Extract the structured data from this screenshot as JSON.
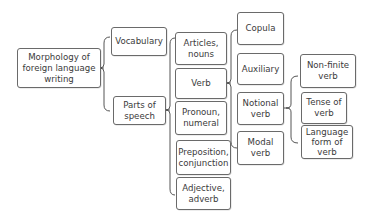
{
  "diagram": {
    "type": "tree-brace-map",
    "root": {
      "label": "Morphology of foreign language writing",
      "lines": [
        "Morphology of",
        "foreign language",
        "writing"
      ]
    },
    "level1": [
      {
        "label": "Vocabulary"
      },
      {
        "label": "Parts of speech",
        "lines": [
          "Parts of",
          "speech"
        ]
      }
    ],
    "parts_of_speech": [
      {
        "label": "Articles, nouns",
        "lines": [
          "Articles,",
          "nouns"
        ]
      },
      {
        "label": "Verb"
      },
      {
        "label": "Pronoun, numeral",
        "lines": [
          "Pronoun,",
          "numeral"
        ]
      },
      {
        "label": "Preposition, conjunction",
        "lines": [
          "Preposition,",
          "conjunction"
        ]
      },
      {
        "label": "Adjective, adverb",
        "lines": [
          "Adjective,",
          "adverb"
        ]
      }
    ],
    "verb_types": [
      {
        "label": "Copula"
      },
      {
        "label": "Auxiliary"
      },
      {
        "label": "Notional verb",
        "lines": [
          "Notional",
          "verb"
        ]
      },
      {
        "label": "Modal verb",
        "lines": [
          "Modal",
          "verb"
        ]
      }
    ],
    "notional_verb_aspects": [
      {
        "label": "Non-finite verb",
        "lines": [
          "Non-finite",
          "verb"
        ]
      },
      {
        "label": "Tense of verb",
        "lines": [
          "Tense of",
          "verb"
        ]
      },
      {
        "label": "Language form of verb",
        "lines": [
          "Language",
          "form of",
          "verb"
        ]
      }
    ],
    "colors": {
      "border": "#6a6a6a",
      "text": "#3a3a3a",
      "connector": "#555555",
      "background": "#ffffff"
    }
  }
}
